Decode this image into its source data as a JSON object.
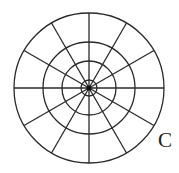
{
  "diagram": {
    "type": "polar-grid",
    "center": [
      89,
      88
    ],
    "ring_radii": [
      75,
      46,
      27,
      8
    ],
    "radial_line_count": 12,
    "radial_angle_step_deg": 30,
    "center_dot_radius": 2.5,
    "stroke_color": "#2a2a2a",
    "stroke_width": 1.3,
    "label": {
      "text": "C",
      "x": 158,
      "y": 130,
      "font_size": 21
    }
  }
}
